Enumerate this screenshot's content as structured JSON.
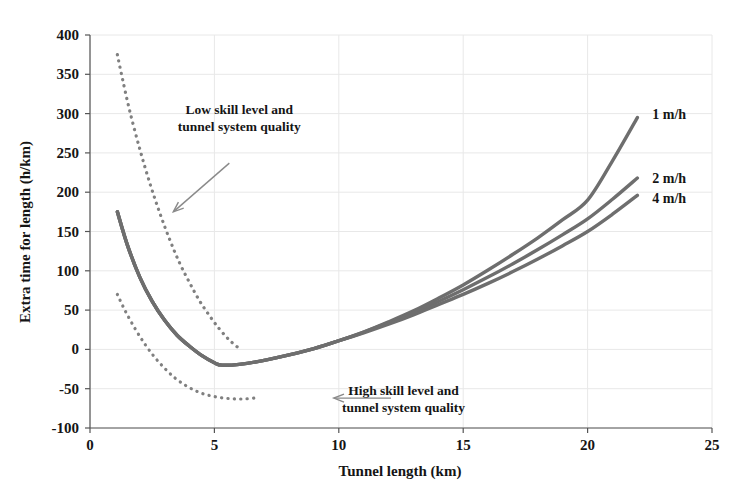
{
  "chart_data": {
    "type": "line",
    "title": "",
    "xlabel": "Tunnel length (km)",
    "ylabel": "Extra time for length (h/km)",
    "xlim": [
      0,
      25
    ],
    "ylim": [
      -100,
      400
    ],
    "xticks": [
      0,
      5,
      10,
      15,
      20,
      25
    ],
    "yticks": [
      -100,
      -50,
      0,
      50,
      100,
      150,
      200,
      250,
      300,
      350,
      400
    ],
    "grid": true,
    "grid_color": "#e8e8e8",
    "legend_position": "right-inline-labels",
    "series": [
      {
        "name": "1 m/h",
        "style": "solid",
        "color": "#6e6e6e",
        "x": [
          1.1,
          1.5,
          2.0,
          2.5,
          3.0,
          3.5,
          4.0,
          4.5,
          5.0,
          5.3,
          6.0,
          7.0,
          8.0,
          9.0,
          10.0,
          11.0,
          12.0,
          13.0,
          14.0,
          15.0,
          16.0,
          17.0,
          18.0,
          19.0,
          20.0,
          21.0,
          22.0
        ],
        "y": [
          175,
          133,
          92,
          61,
          37,
          18,
          4,
          -8,
          -17,
          -20,
          -19,
          -14,
          -7,
          1,
          11,
          22,
          35,
          49,
          65,
          82,
          101,
          121,
          142,
          165,
          190,
          240,
          295
        ]
      },
      {
        "name": "2 m/h",
        "style": "solid",
        "color": "#6e6e6e",
        "x": [
          1.1,
          1.5,
          2.0,
          2.5,
          3.0,
          3.5,
          4.0,
          4.5,
          5.0,
          5.3,
          6.0,
          7.0,
          8.0,
          9.0,
          10.0,
          11.0,
          12.0,
          13.0,
          14.0,
          15.0,
          16.0,
          17.0,
          18.0,
          19.0,
          20.0,
          21.0,
          22.0
        ],
        "y": [
          175,
          133,
          92,
          61,
          37,
          18,
          4,
          -8,
          -17,
          -20,
          -19,
          -14,
          -7,
          1,
          11,
          22,
          34,
          47,
          61,
          76,
          92,
          109,
          127,
          146,
          166,
          191,
          218
        ]
      },
      {
        "name": "4 m/h",
        "style": "solid",
        "color": "#6e6e6e",
        "x": [
          1.1,
          1.5,
          2.0,
          2.5,
          3.0,
          3.5,
          4.0,
          4.5,
          5.0,
          5.3,
          6.0,
          7.0,
          8.0,
          9.0,
          10.0,
          11.0,
          12.0,
          13.0,
          14.0,
          15.0,
          16.0,
          17.0,
          18.0,
          19.0,
          20.0,
          21.0,
          22.0
        ],
        "y": [
          175,
          133,
          92,
          61,
          37,
          18,
          4,
          -8,
          -17,
          -20,
          -19,
          -14,
          -7,
          1,
          11,
          21,
          32,
          44,
          57,
          70,
          84,
          99,
          115,
          132,
          150,
          172,
          196
        ]
      },
      {
        "name": "Low skill level and tunnel system quality",
        "style": "dotted",
        "color": "#808080",
        "x": [
          1.1,
          1.3,
          1.6,
          2.0,
          2.4,
          2.8,
          3.2,
          3.6,
          4.0,
          4.4,
          4.8,
          5.2,
          5.6,
          6.0
        ],
        "y": [
          375,
          345,
          303,
          255,
          212,
          174,
          140,
          110,
          85,
          62,
          43,
          26,
          12,
          1
        ]
      },
      {
        "name": "High skill level and tunnel system quality",
        "style": "dotted",
        "color": "#808080",
        "x": [
          1.1,
          1.4,
          1.8,
          2.2,
          2.6,
          3.0,
          3.4,
          3.8,
          4.2,
          4.6,
          5.0,
          5.4,
          5.8,
          6.2,
          6.6
        ],
        "y": [
          70,
          50,
          27,
          7,
          -10,
          -24,
          -36,
          -45,
          -52,
          -57,
          -60,
          -62,
          -63,
          -63,
          -62
        ]
      }
    ],
    "annotations": [
      {
        "id": "low-skill",
        "lines": [
          "Low skill level and",
          "tunnel system quality"
        ],
        "text_x": 6.0,
        "text_y": 300,
        "arrow_from_x": 5.6,
        "arrow_from_y": 237,
        "arrow_to_x": 3.35,
        "arrow_to_y": 175
      },
      {
        "id": "high-skill",
        "lines": [
          "High skill level and",
          "tunnel system quality"
        ],
        "text_x": 12.6,
        "text_y": -58,
        "arrow_from_x": 12.1,
        "arrow_from_y": -62,
        "arrow_to_x": 9.8,
        "arrow_to_y": -62
      }
    ],
    "series_labels": [
      {
        "text": "1 m/h",
        "x": 22.6,
        "y": 300
      },
      {
        "text": "2 m/h",
        "x": 22.6,
        "y": 218
      },
      {
        "text": "4 m/h",
        "x": 22.6,
        "y": 192
      }
    ]
  }
}
